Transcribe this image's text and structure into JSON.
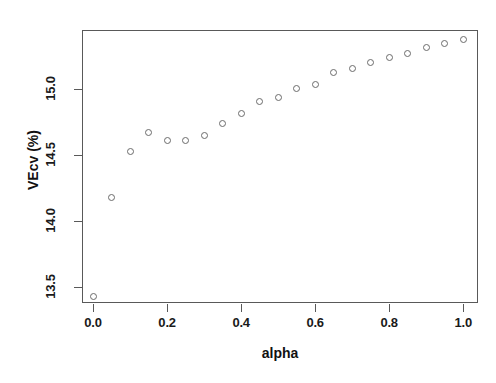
{
  "chart_data": {
    "type": "scatter",
    "title": "",
    "subtitle": "",
    "xlabel": "alpha",
    "ylabel": "VEcv (%)",
    "xlim": [
      -0.03,
      1.04
    ],
    "ylim": [
      13.38,
      15.45
    ],
    "grid": false,
    "legend": null,
    "marker": "open-circle",
    "marker_color": "#6b6b6b",
    "x_ticks": [
      "0.0",
      "0.2",
      "0.4",
      "0.6",
      "0.8",
      "1.0"
    ],
    "x_tick_values": [
      0.0,
      0.2,
      0.4,
      0.6,
      0.8,
      1.0
    ],
    "y_ticks": [
      "13.5",
      "14.0",
      "14.5",
      "15.0"
    ],
    "y_tick_values": [
      13.5,
      14.0,
      14.5,
      15.0
    ],
    "x": [
      0.0,
      0.05,
      0.1,
      0.15,
      0.2,
      0.25,
      0.3,
      0.35,
      0.4,
      0.45,
      0.5,
      0.55,
      0.6,
      0.65,
      0.7,
      0.75,
      0.8,
      0.85,
      0.9,
      0.95,
      1.0
    ],
    "values": [
      13.43,
      14.18,
      14.53,
      14.67,
      14.61,
      14.61,
      14.65,
      14.74,
      14.82,
      14.91,
      14.94,
      15.01,
      15.04,
      15.13,
      15.16,
      15.2,
      15.24,
      15.27,
      15.32,
      15.35,
      15.38
    ],
    "series": [
      {
        "name": "VEcv",
        "values": [
          13.43,
          14.18,
          14.53,
          14.67,
          14.61,
          14.61,
          14.65,
          14.74,
          14.82,
          14.91,
          14.94,
          15.01,
          15.04,
          15.13,
          15.16,
          15.2,
          15.24,
          15.27,
          15.32,
          15.35,
          15.38
        ]
      }
    ]
  },
  "figure": {
    "background": "#ffffff",
    "axis_color": "#595959",
    "text_color": "#111111"
  }
}
